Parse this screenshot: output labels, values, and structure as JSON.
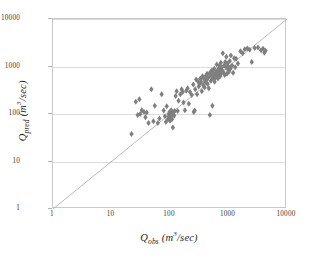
{
  "chart_data": {
    "type": "scatter",
    "title": "",
    "xlabel": "Qobs (m³/sec)",
    "ylabel": "Qpred (m³/sec)",
    "xlabel_parts": {
      "symbol": "Q",
      "sub": "obs",
      "unit": "(m",
      "exp": "3",
      "unit_end": "/sec)"
    },
    "ylabel_parts": {
      "symbol": "Q",
      "sub": "pred",
      "unit": "(m",
      "exp": "3",
      "unit_end": "/sec)"
    },
    "xscale": "log",
    "yscale": "log",
    "xlim": [
      1,
      10000
    ],
    "ylim": [
      1,
      10000
    ],
    "xticks": [
      1,
      10,
      100,
      1000,
      10000
    ],
    "yticks": [
      1,
      10,
      100,
      1000,
      10000
    ],
    "xtick_labels": [
      "1",
      "10",
      "100",
      "1000",
      "10000"
    ],
    "ytick_labels": [
      "1",
      "10",
      "100",
      "1000",
      "10000"
    ],
    "grid": true,
    "grid_axis": "y",
    "legend": false,
    "marker": "diamond",
    "marker_color": "#7f7f7f",
    "marker_size": 3.0,
    "reference_line": {
      "name": "1:1 line",
      "from": [
        1,
        1
      ],
      "to": [
        10000,
        10000
      ],
      "color": "#a8a8a8",
      "width": 0.8
    },
    "series": [
      {
        "name": "Qpred vs Qobs",
        "points": [
          [
            22,
            38
          ],
          [
            26,
            180
          ],
          [
            28,
            95
          ],
          [
            30,
            205
          ],
          [
            31,
            100
          ],
          [
            33,
            120
          ],
          [
            36,
            110
          ],
          [
            38,
            85
          ],
          [
            40,
            108
          ],
          [
            43,
            65
          ],
          [
            48,
            330
          ],
          [
            52,
            70
          ],
          [
            55,
            150
          ],
          [
            62,
            65
          ],
          [
            66,
            80
          ],
          [
            72,
            260
          ],
          [
            78,
            118
          ],
          [
            82,
            90
          ],
          [
            85,
            68
          ],
          [
            88,
            145
          ],
          [
            92,
            78
          ],
          [
            95,
            100
          ],
          [
            96,
            88
          ],
          [
            98,
            110
          ],
          [
            100,
            95
          ],
          [
            100,
            72
          ],
          [
            102,
            86
          ],
          [
            104,
            105
          ],
          [
            105,
            120
          ],
          [
            106,
            95
          ],
          [
            108,
            78
          ],
          [
            110,
            100
          ],
          [
            112,
            52
          ],
          [
            115,
            108
          ],
          [
            118,
            92
          ],
          [
            120,
            115
          ],
          [
            125,
            240
          ],
          [
            130,
            300
          ],
          [
            135,
            115
          ],
          [
            140,
            190
          ],
          [
            150,
            260
          ],
          [
            158,
            330
          ],
          [
            165,
            290
          ],
          [
            170,
            175
          ],
          [
            180,
            120
          ],
          [
            190,
            310
          ],
          [
            200,
            350
          ],
          [
            210,
            165
          ],
          [
            220,
            290
          ],
          [
            235,
            250
          ],
          [
            250,
            420
          ],
          [
            255,
            110
          ],
          [
            265,
            118
          ],
          [
            270,
            330
          ],
          [
            280,
            530
          ],
          [
            290,
            260
          ],
          [
            300,
            490
          ],
          [
            310,
            380
          ],
          [
            320,
            430
          ],
          [
            330,
            560
          ],
          [
            340,
            480
          ],
          [
            350,
            300
          ],
          [
            360,
            620
          ],
          [
            370,
            410
          ],
          [
            380,
            550
          ],
          [
            390,
            360
          ],
          [
            400,
            470
          ],
          [
            410,
            640
          ],
          [
            420,
            520
          ],
          [
            430,
            700
          ],
          [
            440,
            430
          ],
          [
            450,
            580
          ],
          [
            460,
            350
          ],
          [
            470,
            690
          ],
          [
            480,
            95
          ],
          [
            490,
            760
          ],
          [
            500,
            500
          ],
          [
            510,
            620
          ],
          [
            520,
            820
          ],
          [
            530,
            150
          ],
          [
            540,
            560
          ],
          [
            550,
            720
          ],
          [
            560,
            620
          ],
          [
            570,
            900
          ],
          [
            580,
            480
          ],
          [
            590,
            680
          ],
          [
            600,
            580
          ],
          [
            610,
            760
          ],
          [
            620,
            660
          ],
          [
            630,
            1100
          ],
          [
            640,
            700
          ],
          [
            650,
            820
          ],
          [
            660,
            560
          ],
          [
            670,
            740
          ],
          [
            680,
            900
          ],
          [
            690,
            640
          ],
          [
            700,
            1050
          ],
          [
            710,
            780
          ],
          [
            720,
            620
          ],
          [
            730,
            860
          ],
          [
            740,
            1200
          ],
          [
            750,
            700
          ],
          [
            760,
            940
          ],
          [
            780,
            820
          ],
          [
            800,
            1900
          ],
          [
            820,
            760
          ],
          [
            840,
            1050
          ],
          [
            860,
            660
          ],
          [
            880,
            1250
          ],
          [
            900,
            980
          ],
          [
            920,
            1600
          ],
          [
            940,
            700
          ],
          [
            960,
            1150
          ],
          [
            980,
            860
          ],
          [
            1000,
            1000
          ],
          [
            1020,
            780
          ],
          [
            1050,
            1300
          ],
          [
            1080,
            900
          ],
          [
            1100,
            1700
          ],
          [
            1150,
            1050
          ],
          [
            1200,
            740
          ],
          [
            1250,
            1500
          ],
          [
            1300,
            960
          ],
          [
            1350,
            1450
          ],
          [
            1450,
            1150
          ],
          [
            1600,
            2100
          ],
          [
            1750,
            1900
          ],
          [
            1900,
            2300
          ],
          [
            2100,
            2400
          ],
          [
            2300,
            2250
          ],
          [
            2500,
            1250
          ],
          [
            2800,
            2450
          ],
          [
            3200,
            2500
          ],
          [
            3600,
            2200
          ],
          [
            3900,
            2350
          ],
          [
            4100,
            1950
          ],
          [
            4300,
            2150
          ]
        ]
      }
    ]
  }
}
